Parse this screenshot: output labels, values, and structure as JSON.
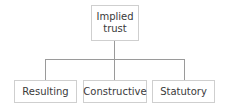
{
  "diagram": {
    "type": "tree",
    "root": {
      "label_line1": "Implied",
      "label_line2": "trust"
    },
    "children": [
      {
        "label": "Resulting"
      },
      {
        "label": "Constructive"
      },
      {
        "label": "Statutory"
      }
    ],
    "colors": {
      "box_border": "#cfcfcf",
      "connector": "#9a9a9a",
      "text": "#3a3a3a"
    }
  }
}
